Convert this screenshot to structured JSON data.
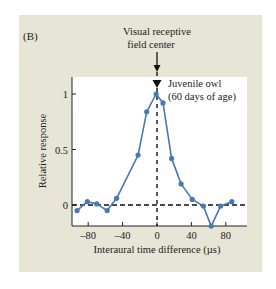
{
  "chart_data": {
    "type": "line",
    "panel_label": "(B)",
    "title": "",
    "xlabel": "Interaural time difference (µs)",
    "ylabel": "Relative response",
    "xlim": [
      -100,
      105
    ],
    "ylim": [
      -0.19,
      1.1
    ],
    "xticks": [
      -80,
      -40,
      0,
      40,
      80
    ],
    "xtick_labels": [
      "–80",
      "–40",
      "0",
      "40",
      "80"
    ],
    "yticks": [
      0,
      0.5,
      1
    ],
    "ytick_labels": [
      "0",
      "0.5",
      "1"
    ],
    "grid": false,
    "series": [
      {
        "name": "Juvenile owl (60 days of age)",
        "color": "#4a78b0",
        "x": [
          -93,
          -81,
          -70,
          -58,
          -47,
          -22,
          -12,
          -1,
          7,
          17,
          28,
          41,
          54,
          63,
          74,
          87
        ],
        "y": [
          -0.05,
          0.03,
          0.01,
          -0.05,
          0.06,
          0.45,
          0.84,
          1.0,
          0.92,
          0.42,
          0.19,
          0.05,
          -0.01,
          -0.19,
          -0.01,
          0.03
        ]
      }
    ],
    "reference_lines": [
      {
        "orientation": "horizontal",
        "value": 0,
        "style": "dashed"
      },
      {
        "orientation": "vertical",
        "value": 0,
        "style": "dashed"
      }
    ],
    "annotations": [
      {
        "text_lines": [
          "Visual receptive",
          "field center"
        ],
        "points_to_x": 0
      },
      {
        "text_lines": [
          "Juvenile owl",
          "(60 days of age)"
        ]
      }
    ]
  },
  "colors": {
    "panel_bg": "#e7e5d5",
    "plot_bg": "#ffffff",
    "series": "#4a78b0",
    "axis": "#222222"
  }
}
